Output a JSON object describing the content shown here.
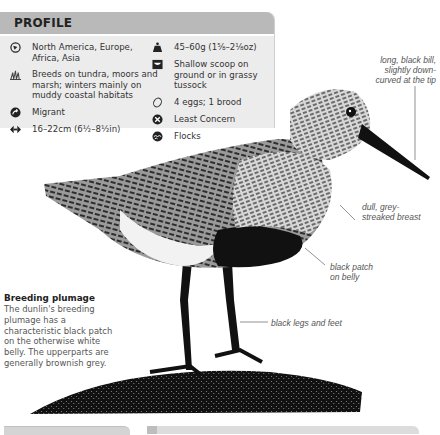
{
  "profile": {
    "title": "PROFILE",
    "left_items": [
      {
        "icon": "globe-icon",
        "text": "North America, Europe, Africa, Asia"
      },
      {
        "icon": "habitat-grass-icon",
        "text": "Breeds on tundra, moors and marsh; winters mainly on muddy coastal habitats"
      },
      {
        "icon": "migration-arrow-icon",
        "text": "Migrant"
      },
      {
        "icon": "length-arrows-icon",
        "text": "16–22cm (6½–8½in)"
      }
    ],
    "right_items": [
      {
        "icon": "weight-icon",
        "text": "45–60g (1⅝–2⅛oz)"
      },
      {
        "icon": "nest-icon",
        "text": "Shallow scoop on ground or in grassy tussock"
      },
      {
        "icon": "egg-icon",
        "text": "4 eggs; 1 brood"
      },
      {
        "icon": "conservation-status-icon",
        "text": "Least Concern"
      },
      {
        "icon": "flock-icon",
        "text": "Flocks"
      }
    ]
  },
  "annotations": {
    "bill": "long, black bill, slightly down-curved at the tip",
    "breast": "dull, grey-streaked breast",
    "belly": "black patch on belly",
    "legs": "black legs and feet"
  },
  "caption": {
    "title": "Breeding plumage",
    "body": "The dunlin's breeding plumage has a characteristic black patch on the otherwise white belly. The upperparts are generally brownish grey."
  }
}
